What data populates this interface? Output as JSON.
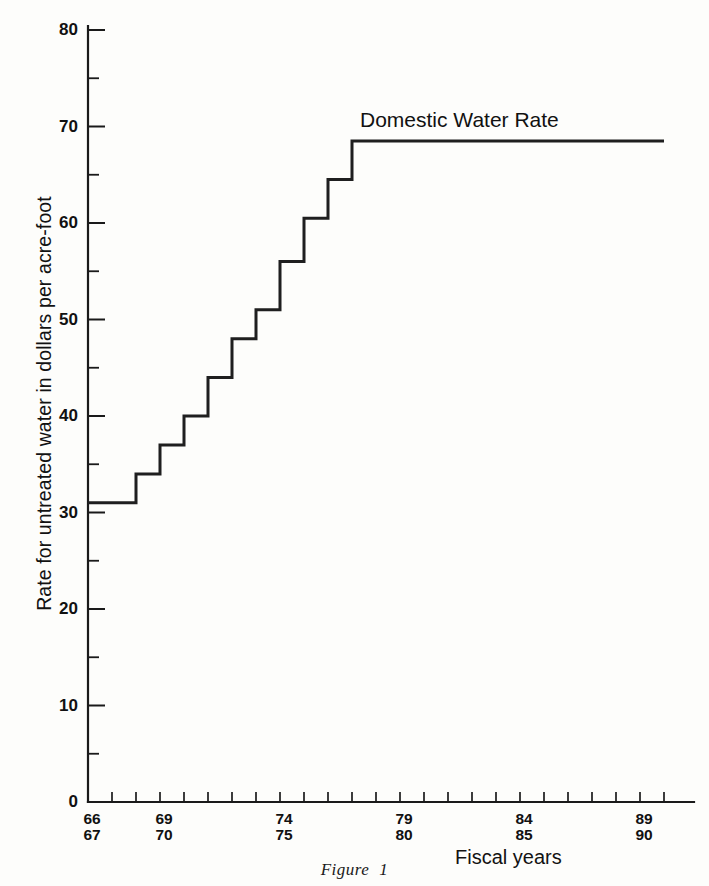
{
  "figure": {
    "caption_label": "Figure",
    "caption_number": "1"
  },
  "annotation": {
    "series_label": "Domestic Water Rate"
  },
  "axes": {
    "y_title": "Rate for untreated water in dollars per acre-foot",
    "x_title": "Fiscal years"
  },
  "chart_data": {
    "type": "line",
    "subtype": "step",
    "title": "",
    "xlabel": "Fiscal years",
    "ylabel": "Rate for untreated water in dollars per acre-foot",
    "ylim": [
      0,
      80
    ],
    "ytick_labels": [
      "0",
      "10",
      "20",
      "30",
      "40",
      "50",
      "60",
      "70",
      "80"
    ],
    "ytick_values": [
      0,
      10,
      20,
      30,
      40,
      50,
      60,
      70,
      80
    ],
    "yminor_step": 5,
    "grid": false,
    "legend_position": "inline-annotation",
    "xlim_years": [
      1966,
      1990
    ],
    "xtick_years": [
      1966,
      1967,
      1968,
      1969,
      1970,
      1971,
      1972,
      1973,
      1974,
      1975,
      1976,
      1977,
      1978,
      1979,
      1980,
      1981,
      1982,
      1983,
      1984,
      1985,
      1986,
      1987,
      1988,
      1989,
      1990
    ],
    "xtick_labels": [
      {
        "year": 1966,
        "top": "66",
        "bottom": "67"
      },
      {
        "year": 1969,
        "top": "69",
        "bottom": "70"
      },
      {
        "year": 1974,
        "top": "74",
        "bottom": "75"
      },
      {
        "year": 1979,
        "top": "79",
        "bottom": "80"
      },
      {
        "year": 1984,
        "top": "84",
        "bottom": "85"
      },
      {
        "year": 1989,
        "top": "89",
        "bottom": "90"
      }
    ],
    "series": [
      {
        "name": "Domestic Water Rate",
        "x": [
          1966,
          1967,
          1968,
          1969,
          1970,
          1971,
          1972,
          1973,
          1974,
          1975,
          1976,
          1977,
          1990
        ],
        "values": [
          31,
          31,
          34,
          37,
          40,
          44,
          48,
          51,
          56,
          60.5,
          64.5,
          68.5,
          68.5
        ]
      }
    ]
  }
}
